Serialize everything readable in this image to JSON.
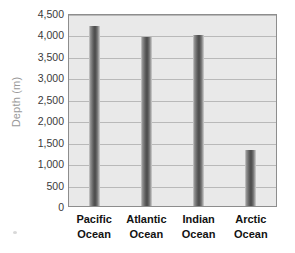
{
  "chart_data": {
    "type": "bar",
    "title": "",
    "xlabel": "",
    "ylabel": "Depth (m)",
    "categories": [
      "Pacific Ocean",
      "Atlantic Ocean",
      "Indian Ocean",
      "Arctic Ocean"
    ],
    "category_lines": [
      [
        "Pacific",
        "Ocean"
      ],
      [
        "Atlantic",
        "Ocean"
      ],
      [
        "Indian",
        "Ocean"
      ],
      [
        "Arctic",
        "Ocean"
      ]
    ],
    "values": [
      4200,
      3950,
      3980,
      1300
    ],
    "ylim": [
      0,
      4500
    ],
    "ytick_step": 500,
    "ytick_labels": [
      "4,500",
      "4,000",
      "3,500",
      "3,000",
      "2,500",
      "2,000",
      "1,500",
      "1,000",
      "500",
      "0"
    ],
    "ytick_values": [
      4500,
      4000,
      3500,
      3000,
      2500,
      2000,
      1500,
      1000,
      500,
      0
    ],
    "grid": true,
    "legend": false,
    "colors": {
      "plot_background": "#e9e9e9",
      "plot_border": "#8d8d8d",
      "gridline": "#b9b9b9",
      "bar_dark": "#4a4a4a",
      "bar_light": "#d6d6d6",
      "axis_title": "#9a9a9a",
      "tick_label": "#3a3a3a",
      "category_label": "#121212",
      "page_background": "#ffffff"
    }
  }
}
